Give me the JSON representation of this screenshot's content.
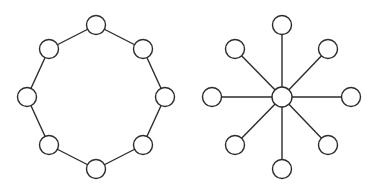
{
  "diagram": {
    "colors": {
      "stroke": "#2b2b2b",
      "fill": "#ffffff",
      "background": "#ffffff"
    },
    "node_radius": 9.5,
    "graphs": [
      {
        "name": "ring-topology",
        "type": "ring",
        "nodes": [
          {
            "id": "r0",
            "x": 96,
            "y": 25
          },
          {
            "id": "r1",
            "x": 143,
            "y": 49
          },
          {
            "id": "r2",
            "x": 165,
            "y": 97
          },
          {
            "id": "r3",
            "x": 143,
            "y": 145
          },
          {
            "id": "r4",
            "x": 96,
            "y": 169
          },
          {
            "id": "r5",
            "x": 49,
            "y": 145
          },
          {
            "id": "r6",
            "x": 27,
            "y": 97
          },
          {
            "id": "r7",
            "x": 49,
            "y": 49
          }
        ],
        "edges": [
          [
            "r0",
            "r1"
          ],
          [
            "r1",
            "r2"
          ],
          [
            "r2",
            "r3"
          ],
          [
            "r3",
            "r4"
          ],
          [
            "r4",
            "r5"
          ],
          [
            "r5",
            "r6"
          ],
          [
            "r6",
            "r7"
          ],
          [
            "r7",
            "r0"
          ]
        ]
      },
      {
        "name": "star-topology",
        "type": "star",
        "nodes": [
          {
            "id": "hub",
            "x": 282,
            "y": 97
          },
          {
            "id": "s0",
            "x": 282,
            "y": 25
          },
          {
            "id": "s1",
            "x": 328,
            "y": 49
          },
          {
            "id": "s2",
            "x": 351,
            "y": 97
          },
          {
            "id": "s3",
            "x": 328,
            "y": 145
          },
          {
            "id": "s4",
            "x": 282,
            "y": 169
          },
          {
            "id": "s5",
            "x": 235,
            "y": 145
          },
          {
            "id": "s6",
            "x": 212,
            "y": 97
          },
          {
            "id": "s7",
            "x": 235,
            "y": 49
          }
        ],
        "edges": [
          [
            "hub",
            "s0"
          ],
          [
            "hub",
            "s1"
          ],
          [
            "hub",
            "s2"
          ],
          [
            "hub",
            "s3"
          ],
          [
            "hub",
            "s4"
          ],
          [
            "hub",
            "s5"
          ],
          [
            "hub",
            "s6"
          ],
          [
            "hub",
            "s7"
          ]
        ]
      }
    ]
  }
}
